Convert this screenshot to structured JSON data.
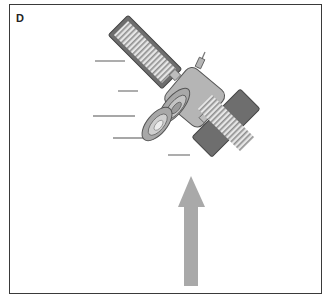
{
  "figure": {
    "panel_label": "D",
    "colors": {
      "border": "#3a3a3a",
      "body_fill": "#b5b5b5",
      "body_stroke": "#555555",
      "panel_stripe": "#e6e6e6",
      "arrow_fill": "#a9a9a9",
      "motion_line": "#8a8a8a"
    },
    "elements": {
      "satellite": "satellite-icon",
      "solar_panels": 2,
      "motion_lines": 5,
      "arrow_direction": "up"
    }
  }
}
